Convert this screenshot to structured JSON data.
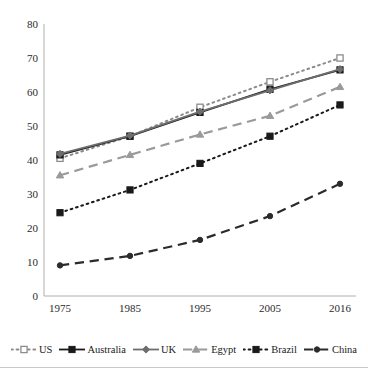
{
  "chart_data": {
    "type": "line",
    "title": "",
    "subtitle": "",
    "xlabel": "",
    "ylabel": "",
    "categories": [
      "1975",
      "1985",
      "1995",
      "2005",
      "2016"
    ],
    "x_tick_labels": [
      "1975",
      "1985",
      "1995",
      "2005",
      "2016"
    ],
    "y_tick_labels": [
      "0",
      "10",
      "20",
      "30",
      "40",
      "50",
      "60",
      "70",
      "80"
    ],
    "ylim": [
      0,
      80
    ],
    "y_tick_step": 10,
    "grid": false,
    "legend_position": "bottom",
    "series": [
      {
        "name": "US",
        "values": [
          40.5,
          47.0,
          55.5,
          63.0,
          70.0
        ],
        "line_style": "dotted",
        "marker": "square-open",
        "color": "#8c8c8c"
      },
      {
        "name": "Australia",
        "values": [
          41.5,
          47.0,
          54.0,
          60.8,
          66.5
        ],
        "line_style": "solid",
        "marker": "square-filled",
        "color": "#1a1a1a"
      },
      {
        "name": "UK",
        "values": [
          41.8,
          47.2,
          54.2,
          60.5,
          66.7
        ],
        "line_style": "solid",
        "marker": "diamond",
        "color": "#6e6e6e"
      },
      {
        "name": "Egypt",
        "values": [
          35.5,
          41.5,
          47.5,
          53.0,
          61.5
        ],
        "line_style": "dashed",
        "marker": "triangle",
        "color": "#9a9a9a"
      },
      {
        "name": "Brazil",
        "values": [
          24.5,
          31.2,
          39.0,
          47.0,
          56.2
        ],
        "line_style": "dotted",
        "marker": "square-filled",
        "color": "#1a1a1a"
      },
      {
        "name": "China",
        "values": [
          9.0,
          11.8,
          16.5,
          23.5,
          33.0
        ],
        "line_style": "dashed",
        "marker": "circle-filled",
        "color": "#2b2b2b"
      }
    ]
  },
  "legend": {
    "items": [
      {
        "label": "US",
        "key": "dotted-square-open"
      },
      {
        "label": "Australia",
        "key": "solid-square-filled"
      },
      {
        "label": "UK",
        "key": "solid-diamond"
      },
      {
        "label": "Egypt",
        "key": "dashed-triangle"
      },
      {
        "label": "Brazil",
        "key": "dotted-square-filled"
      },
      {
        "label": "China",
        "key": "dashed-circle-filled"
      }
    ]
  },
  "axis": {
    "y_axis_name": "y-axis",
    "x_axis_name": "x-axis"
  },
  "colors": {
    "axis": "#b0b0b0",
    "text": "#1a1a1a",
    "rule": "#c8c8c8"
  }
}
